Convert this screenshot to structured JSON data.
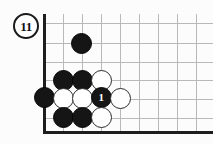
{
  "diagram": {
    "kind": "go-board-problem-diagram",
    "figure_number": "11",
    "badge_label": "11",
    "colors": {
      "background": "#fcfcfc",
      "grid_line": "#b9b9b9",
      "board_edge": "#1e1e1e",
      "black_stone": "#151515",
      "white_stone": "#ffffff",
      "stone_outline": "#2a2a2a",
      "label_on_black": "#ffffff"
    },
    "board": {
      "edges": [
        {
          "name": "left-edge",
          "orientation": "v"
        },
        {
          "name": "bottom-edge",
          "orientation": "h"
        }
      ],
      "horizontal_lines": [
        23,
        43,
        62,
        80,
        99,
        118
      ],
      "vertical_lines": [
        63,
        82,
        101,
        120,
        139,
        158,
        177,
        196
      ],
      "origin_x": 44,
      "origin_y": 131,
      "spacing": 19
    },
    "stones": [
      {
        "id": "s1",
        "color": "black",
        "cx": 81,
        "cy": 43,
        "label": ""
      },
      {
        "id": "s2",
        "color": "black",
        "cx": 63,
        "cy": 80,
        "label": ""
      },
      {
        "id": "s3",
        "color": "black",
        "cx": 82,
        "cy": 80,
        "label": ""
      },
      {
        "id": "s4",
        "color": "white",
        "cx": 101,
        "cy": 80,
        "label": ""
      },
      {
        "id": "s5",
        "color": "black",
        "cx": 44,
        "cy": 97,
        "label": ""
      },
      {
        "id": "s6",
        "color": "white",
        "cx": 63,
        "cy": 98,
        "label": ""
      },
      {
        "id": "s7",
        "color": "white",
        "cx": 82,
        "cy": 98,
        "label": ""
      },
      {
        "id": "s8",
        "color": "black",
        "cx": 101,
        "cy": 97,
        "label": "1"
      },
      {
        "id": "s9",
        "color": "white",
        "cx": 120,
        "cy": 98,
        "label": ""
      },
      {
        "id": "s10",
        "color": "black",
        "cx": 63,
        "cy": 117,
        "label": ""
      },
      {
        "id": "s11",
        "color": "black",
        "cx": 82,
        "cy": 117,
        "label": ""
      },
      {
        "id": "s12",
        "color": "white",
        "cx": 101,
        "cy": 117,
        "label": ""
      }
    ]
  }
}
